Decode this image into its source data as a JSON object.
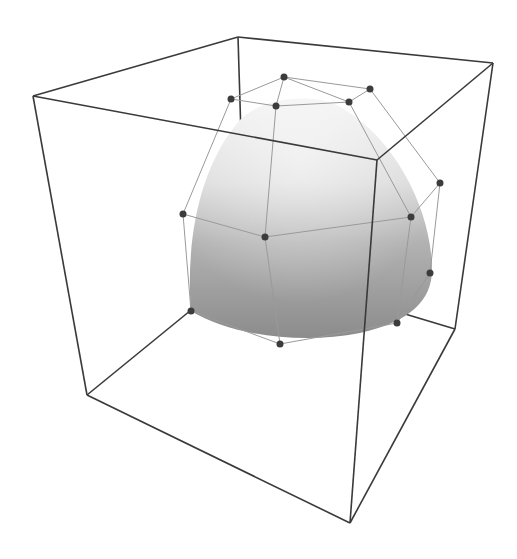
{
  "figure": {
    "colors": {
      "background": "#ffffff",
      "cube_edge": "#3a3a3a",
      "control_net": "#9a9a9a",
      "control_point": "#3c3c3c",
      "surface_light": "#ececec",
      "surface_mid": "#c4c4c4",
      "surface_dark": "#8e8e8e"
    },
    "cube": {
      "vertices": {
        "top_left": [
          33,
          96
        ],
        "top_back": [
          238,
          37
        ],
        "top_right": [
          493,
          63
        ],
        "top_front": [
          377,
          160
        ],
        "bottom_left": [
          87,
          395
        ],
        "bottom_back": [
          245,
          266
        ],
        "bottom_right": [
          455,
          329
        ],
        "bottom_front": [
          350,
          523
        ]
      }
    },
    "control_points": [
      {
        "id": "p0",
        "x": 231,
        "y": 99
      },
      {
        "id": "p1",
        "x": 284,
        "y": 77
      },
      {
        "id": "p2",
        "x": 370,
        "y": 89
      },
      {
        "id": "p3",
        "x": 276,
        "y": 106
      },
      {
        "id": "p4",
        "x": 349,
        "y": 102
      },
      {
        "id": "p5",
        "x": 183,
        "y": 214
      },
      {
        "id": "p6",
        "x": 265,
        "y": 237
      },
      {
        "id": "p7",
        "x": 411,
        "y": 217
      },
      {
        "id": "p8",
        "x": 440,
        "y": 183
      },
      {
        "id": "p9",
        "x": 430,
        "y": 273
      },
      {
        "id": "p10",
        "x": 397,
        "y": 323
      },
      {
        "id": "p11",
        "x": 280,
        "y": 344
      },
      {
        "id": "p12",
        "x": 191,
        "y": 311
      }
    ]
  }
}
